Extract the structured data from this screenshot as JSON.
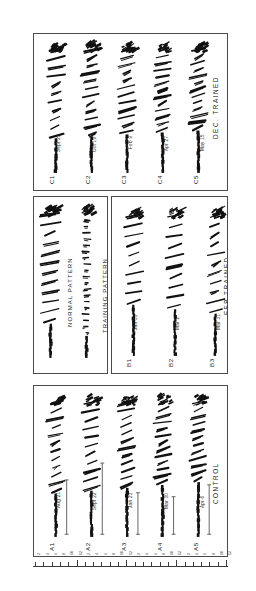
{
  "figure": {
    "orientation": "rotated-90",
    "background_color": "#ffffff",
    "ink_color": "#111111",
    "border_color": "#4a4a4a"
  },
  "panels": [
    {
      "id": "panel-c",
      "group_caption": "DEC. TRAINED",
      "rows": [
        {
          "id": "C1",
          "date": "Sept 23"
        },
        {
          "id": "C2",
          "date": "Oct 19"
        },
        {
          "id": "C3",
          "date": "Feb 9"
        },
        {
          "id": "C4",
          "date": "Apr 27"
        },
        {
          "id": "C5",
          "date": "May 15"
        }
      ]
    },
    {
      "id": "panel-legend",
      "captions": [
        {
          "label": "NORMAL PATTERN"
        },
        {
          "label": "TRAINING PATTERN"
        }
      ]
    },
    {
      "id": "panel-b",
      "group_caption": "FEB TRAINED",
      "rows": [
        {
          "id": "B1",
          "date": "Jan 31"
        },
        {
          "id": "B2",
          "date": "Mar 2"
        },
        {
          "id": "B3",
          "date": "Mar 31"
        }
      ]
    },
    {
      "id": "panel-a",
      "group_caption": "CONTROL",
      "rows": [
        {
          "id": "A1",
          "date": "Aug 21"
        },
        {
          "id": "A2",
          "date": "Sept 22"
        },
        {
          "id": "A3",
          "date": "Jan 23"
        },
        {
          "id": "A4",
          "date": "Mar 30"
        },
        {
          "id": "A5",
          "date": "Apr 6"
        }
      ]
    }
  ],
  "ruler": {
    "tick_labels": [
      "2",
      "4",
      "6",
      "8",
      "10",
      "12",
      "2",
      "4",
      "6",
      "8",
      "10",
      "12",
      "2",
      "4",
      "6",
      "8",
      "10",
      "12",
      "2",
      "4",
      "6",
      "8",
      "10",
      "12"
    ],
    "major_labels": [
      "12",
      "12",
      "12",
      "12"
    ]
  },
  "chart_data": {
    "type": "line",
    "title": "",
    "xlabel": "",
    "ylabel": "",
    "series": [
      {
        "name": "C1",
        "group": "DEC. TRAINED",
        "date": "Sept 23",
        "pattern": "normal",
        "density": 0.82,
        "burst_count": 11
      },
      {
        "name": "C2",
        "group": "DEC. TRAINED",
        "date": "Oct 19",
        "pattern": "normal",
        "density": 0.7,
        "burst_count": 12
      },
      {
        "name": "C3",
        "group": "DEC. TRAINED",
        "date": "Feb 9",
        "pattern": "normal",
        "density": 0.66,
        "burst_count": 12
      },
      {
        "name": "C4",
        "group": "DEC. TRAINED",
        "date": "Apr 27",
        "pattern": "normal",
        "density": 0.74,
        "burst_count": 13
      },
      {
        "name": "C5",
        "group": "DEC. TRAINED",
        "date": "May 15",
        "pattern": "normal",
        "density": 0.72,
        "burst_count": 13
      },
      {
        "name": "B1",
        "group": "FEB TRAINED",
        "date": "Jan 31",
        "pattern": "normal",
        "density": 0.64,
        "burst_count": 10
      },
      {
        "name": "B2",
        "group": "FEB TRAINED",
        "date": "Mar 2",
        "pattern": "training",
        "density": 0.6,
        "burst_count": 10
      },
      {
        "name": "B3",
        "group": "FEB TRAINED",
        "date": "Mar 31",
        "pattern": "training",
        "density": 0.68,
        "burst_count": 11
      },
      {
        "name": "A1",
        "group": "CONTROL",
        "date": "Aug 21",
        "pattern": "normal",
        "density": 0.78,
        "burst_count": 12
      },
      {
        "name": "A2",
        "group": "CONTROL",
        "date": "Sept 22",
        "pattern": "normal",
        "density": 0.69,
        "burst_count": 11
      },
      {
        "name": "A3",
        "group": "CONTROL",
        "date": "Jan 23",
        "pattern": "normal",
        "density": 0.71,
        "burst_count": 12
      },
      {
        "name": "A4",
        "group": "CONTROL",
        "date": "Mar 30",
        "pattern": "normal",
        "density": 0.76,
        "burst_count": 13
      },
      {
        "name": "A5",
        "group": "CONTROL",
        "date": "Apr 6",
        "pattern": "normal",
        "density": 0.73,
        "burst_count": 12
      }
    ],
    "legend": [
      "NORMAL PATTERN",
      "TRAINING PATTERN"
    ],
    "legend_position": "middle-left-panel",
    "grid": false
  }
}
